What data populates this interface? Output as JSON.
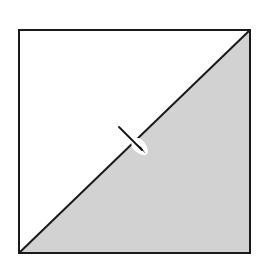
{
  "diagram": {
    "colors": {
      "background": "#ffffff",
      "upper_left_triangle": "#ffffff",
      "lower_right_triangle": "#d2d2d2",
      "outline": "#1a1a1a",
      "notch": "#ffffff"
    },
    "square": {
      "x": 19,
      "y": 30,
      "width": 231,
      "height": 223
    },
    "diagonal": {
      "from": "bottom-left",
      "to": "top-right"
    },
    "pointer": {
      "x1": 119,
      "y1": 127,
      "x2": 141,
      "y2": 148
    }
  }
}
